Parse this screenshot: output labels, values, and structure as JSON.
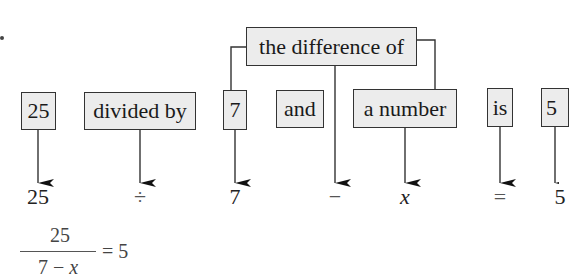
{
  "diagram": {
    "phrase_boxes": [
      {
        "id": "twenty-five",
        "label": "25"
      },
      {
        "id": "divided-by",
        "label": "divided by"
      },
      {
        "id": "seven",
        "label": "7"
      },
      {
        "id": "and",
        "label": "and"
      },
      {
        "id": "a-number",
        "label": "a number"
      },
      {
        "id": "is",
        "label": "is"
      },
      {
        "id": "five",
        "label": "5"
      }
    ],
    "group_box": {
      "label": "the difference of"
    },
    "symbols": [
      {
        "for": "twenty-five",
        "value": "25"
      },
      {
        "for": "divided-by",
        "value": "÷"
      },
      {
        "for": "seven",
        "value": "7"
      },
      {
        "for": "the-difference-of",
        "value": "−"
      },
      {
        "for": "a-number",
        "value": "x"
      },
      {
        "for": "is",
        "value": "="
      },
      {
        "for": "five",
        "value": "5"
      }
    ],
    "equation": {
      "numerator": "25",
      "denominator_left": "7 − ",
      "denominator_var": "x",
      "rhs": "= 5"
    },
    "top_fragments": [
      "x",
      "="
    ]
  }
}
